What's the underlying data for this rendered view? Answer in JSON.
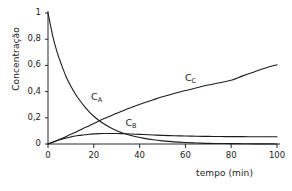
{
  "chart_data": {
    "type": "line",
    "title": "",
    "xlabel": "tempo (min)",
    "ylabel": "Concentração",
    "xlim": [
      0,
      100
    ],
    "ylim": [
      0,
      1
    ],
    "grid": false,
    "legend": "inline-curve-labels",
    "xticks": [
      "0",
      "20",
      "40",
      "60",
      "80",
      "100"
    ],
    "xtick_values": [
      0,
      20,
      40,
      60,
      80,
      100
    ],
    "yticks": [
      "0",
      "0,2",
      "0,4",
      "0,6",
      "0,8",
      "1"
    ],
    "ytick_values": [
      0,
      0.2,
      0.4,
      0.6,
      0.8,
      1
    ],
    "x": [
      0,
      2,
      4,
      6,
      8,
      10,
      12,
      14,
      16,
      18,
      20,
      22,
      24,
      26,
      28,
      30,
      34,
      38,
      42,
      46,
      50,
      55,
      60,
      65,
      70,
      75,
      80,
      85,
      90,
      95,
      100
    ],
    "series": [
      {
        "name": "C_A",
        "label": "C",
        "sublabel": "A",
        "color": "#1c1c1c",
        "label_x": 21,
        "label_y": 0.35,
        "values": [
          1.0,
          0.83,
          0.7,
          0.6,
          0.51,
          0.44,
          0.38,
          0.33,
          0.285,
          0.245,
          0.212,
          0.183,
          0.158,
          0.137,
          0.118,
          0.102,
          0.076,
          0.057,
          0.043,
          0.032,
          0.024,
          0.016,
          0.011,
          0.008,
          0.005,
          0.004,
          0.003,
          0.002,
          0.001,
          0.001,
          0.0
        ]
      },
      {
        "name": "C_B",
        "label": "C",
        "sublabel": "B",
        "color": "#1c1c1c",
        "label_x": 36,
        "label_y": 0.155,
        "values": [
          0.0,
          0.014,
          0.026,
          0.037,
          0.046,
          0.054,
          0.061,
          0.066,
          0.071,
          0.074,
          0.077,
          0.079,
          0.08,
          0.0805,
          0.0805,
          0.08,
          0.078,
          0.075,
          0.072,
          0.069,
          0.066,
          0.063,
          0.061,
          0.059,
          0.058,
          0.057,
          0.056,
          0.056,
          0.055,
          0.055,
          0.055
        ]
      },
      {
        "name": "C_C",
        "label": "C",
        "sublabel": "C",
        "color": "#1c1c1c",
        "label_x": 62,
        "label_y": 0.5,
        "values": [
          0.0,
          0.013,
          0.027,
          0.042,
          0.058,
          0.074,
          0.09,
          0.107,
          0.124,
          0.14,
          0.157,
          0.173,
          0.19,
          0.205,
          0.22,
          0.235,
          0.264,
          0.29,
          0.315,
          0.338,
          0.36,
          0.385,
          0.408,
          0.43,
          0.45,
          0.468,
          0.486,
          0.52,
          0.55,
          0.58,
          0.605
        ]
      }
    ]
  }
}
